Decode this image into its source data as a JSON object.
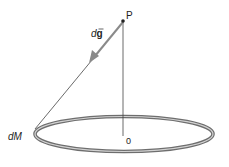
{
  "diagram": {
    "type": "ring-gravitational-field",
    "labels": {
      "point": "P",
      "field_element_prefix": "d",
      "field_element_vector": "g",
      "mass_element": "dM",
      "center": "0"
    },
    "colors": {
      "ring_outer": "#6e6e6e",
      "ring_inner": "#c8c8c8",
      "arrow": "#8a8a8a",
      "line": "#444444",
      "text": "#222222"
    }
  }
}
